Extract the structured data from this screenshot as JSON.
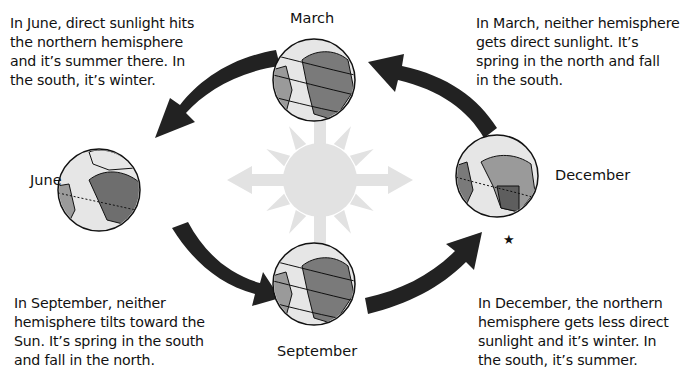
{
  "captions": {
    "june": "In June, direct sunlight hits the northern hemisphere and it’s summer there. In the south, it’s winter.",
    "march": "In March, neither hemisphere gets direct sunlight. It’s spring in the north and fall in the south.",
    "september": "In September, neither hemisphere tilts toward the Sun. It’s spring in the south and fall in the north.",
    "december": "In December, the northern hemisphere gets less direct sunlight and it’s winter. In the south, it’s summer."
  },
  "captions_lines": {
    "june": [
      "In June, direct sunlight hits",
      "the northern hemisphere",
      "and it’s summer there. In",
      "the south, it’s winter."
    ],
    "march": [
      "In March, neither hemisphere",
      "gets direct sunlight. It’s",
      "spring in the north and fall",
      "in the south."
    ],
    "september": [
      "In September, neither",
      "hemisphere tilts toward the",
      "Sun. It’s spring in the south",
      "and fall in the north."
    ],
    "december": [
      "In December, the northern",
      "hemisphere gets less direct",
      "sunlight and it’s winter. In",
      "the south, it’s summer."
    ]
  },
  "labels": {
    "march": "March",
    "june": "June",
    "september": "September",
    "december": "December"
  },
  "marker": "★",
  "colors": {
    "arrow": "#222222",
    "sun": "#e2e2e2",
    "ocean": "#e6e6e6",
    "land": "#7a7a7a",
    "land_light": "#b8b8b8"
  },
  "icons": [
    "sun-icon",
    "earth-globe-icon",
    "orbit-arrow-icon",
    "star-icon"
  ]
}
